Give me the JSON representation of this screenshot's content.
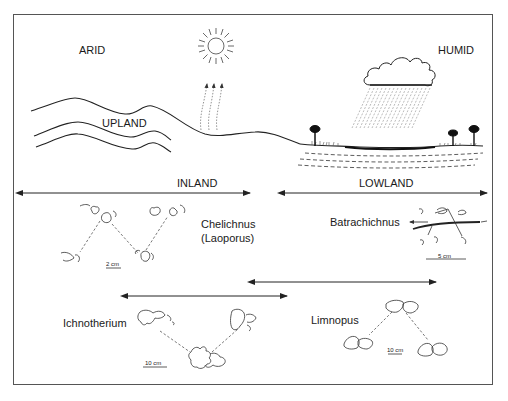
{
  "figure": {
    "climate_labels": {
      "arid": "ARID",
      "humid": "HUMID"
    },
    "terrain_labels": {
      "upland": "UPLAND"
    },
    "zones": {
      "inland": "INLAND",
      "lowland": "LOWLAND"
    },
    "trackways": [
      {
        "name": "Chelichnus",
        "alt_name": "(Laoporus)",
        "scale": "2 cm"
      },
      {
        "name": "Batrachichnus",
        "scale": "5 cm"
      },
      {
        "name": "Ichnotherium",
        "scale": "10 cm"
      },
      {
        "name": "Limnopus",
        "scale": "10 cm"
      }
    ],
    "icons": [
      "sun-icon",
      "rain-cloud-icon",
      "tree-icon",
      "evaporation-arrows-icon",
      "footprint-icon"
    ]
  }
}
